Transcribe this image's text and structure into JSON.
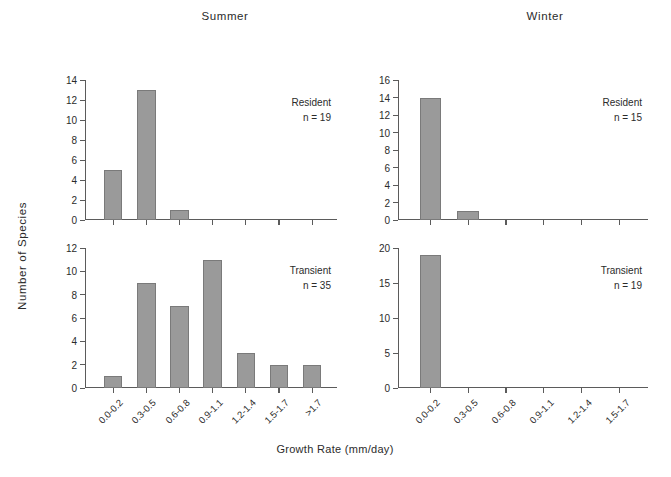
{
  "figure": {
    "x_axis_title": "Growth Rate (mm/day)",
    "y_axis_title": "Number of Species",
    "bar_color": "#9a9a9a",
    "axis_color": "#5b5b5b",
    "background": "#ffffff"
  },
  "columns": [
    {
      "key": "summer",
      "title": "Summer"
    },
    {
      "key": "winter",
      "title": "Winter"
    }
  ],
  "panels": [
    {
      "id": "summer-resident",
      "season": "Summer",
      "group": "Resident",
      "n_label": "n = 19",
      "categories": [
        "0.0-0.2",
        "0.3-0.5",
        "0.6-0.8",
        "0.9-1.1",
        "1.2-1.4",
        "1.5-1.7",
        ">1.7"
      ],
      "values": [
        5,
        13,
        1,
        0,
        0,
        0,
        0
      ],
      "yticks": [
        0,
        2,
        4,
        6,
        8,
        10,
        12,
        14
      ],
      "ymax": 14,
      "show_xlabels": false
    },
    {
      "id": "summer-transient",
      "season": "Summer",
      "group": "Transient",
      "n_label": "n = 35",
      "categories": [
        "0.0-0.2",
        "0.3-0.5",
        "0.6-0.8",
        "0.9-1.1",
        "1.2-1.4",
        "1.5-1.7",
        ">1.7"
      ],
      "values": [
        1,
        9,
        7,
        11,
        3,
        2,
        2
      ],
      "yticks": [
        0,
        2,
        4,
        6,
        8,
        10,
        12
      ],
      "ymax": 12,
      "show_xlabels": true
    },
    {
      "id": "winter-resident",
      "season": "Winter",
      "group": "Resident",
      "n_label": "n = 15",
      "categories": [
        "0.0-0.2",
        "0.3-0.5",
        "0.6-0.8",
        "0.9-1.1",
        "1.2-1.4",
        "1.5-1.7"
      ],
      "values": [
        14,
        1,
        0,
        0,
        0,
        0
      ],
      "yticks": [
        0,
        2,
        4,
        6,
        8,
        10,
        12,
        14,
        16
      ],
      "ymax": 16,
      "show_xlabels": false
    },
    {
      "id": "winter-transient",
      "season": "Winter",
      "group": "Transient",
      "n_label": "n = 19",
      "categories": [
        "0.0-0.2",
        "0.3-0.5",
        "0.6-0.8",
        "0.9-1.1",
        "1.2-1.4",
        "1.5-1.7"
      ],
      "values": [
        19,
        0,
        0,
        0,
        0,
        0
      ],
      "yticks": [
        0,
        5,
        10,
        15,
        20
      ],
      "ymax": 20,
      "show_xlabels": true
    }
  ],
  "chart_data": {
    "type": "bar",
    "title": "",
    "xlabel": "Growth Rate (mm/day)",
    "ylabel": "Number of Species",
    "grid": false,
    "legend": "none",
    "panel_layout": "2 columns (Summer, Winter) x 2 rows (Resident, Transient)",
    "panels": [
      {
        "name": "Summer Resident",
        "season": "Summer",
        "group": "Resident",
        "n": 19,
        "categories": [
          "0.0-0.2",
          "0.3-0.5",
          "0.6-0.8",
          "0.9-1.1",
          "1.2-1.4",
          "1.5-1.7",
          ">1.7"
        ],
        "values": [
          5,
          13,
          1,
          0,
          0,
          0,
          0
        ],
        "ylim": [
          0,
          14
        ],
        "yticks": [
          0,
          2,
          4,
          6,
          8,
          10,
          12,
          14
        ]
      },
      {
        "name": "Summer Transient",
        "season": "Summer",
        "group": "Transient",
        "n": 35,
        "categories": [
          "0.0-0.2",
          "0.3-0.5",
          "0.6-0.8",
          "0.9-1.1",
          "1.2-1.4",
          "1.5-1.7",
          ">1.7"
        ],
        "values": [
          1,
          9,
          7,
          11,
          3,
          2,
          2
        ],
        "ylim": [
          0,
          12
        ],
        "yticks": [
          0,
          2,
          4,
          6,
          8,
          10,
          12
        ]
      },
      {
        "name": "Winter Resident",
        "season": "Winter",
        "group": "Resident",
        "n": 15,
        "categories": [
          "0.0-0.2",
          "0.3-0.5",
          "0.6-0.8",
          "0.9-1.1",
          "1.2-1.4",
          "1.5-1.7"
        ],
        "values": [
          14,
          1,
          0,
          0,
          0,
          0
        ],
        "ylim": [
          0,
          16
        ],
        "yticks": [
          0,
          2,
          4,
          6,
          8,
          10,
          12,
          14,
          16
        ]
      },
      {
        "name": "Winter Transient",
        "season": "Winter",
        "group": "Transient",
        "n": 19,
        "categories": [
          "0.0-0.2",
          "0.3-0.5",
          "0.6-0.8",
          "0.9-1.1",
          "1.2-1.4",
          "1.5-1.7"
        ],
        "values": [
          19,
          0,
          0,
          0,
          0,
          0
        ],
        "ylim": [
          0,
          20
        ],
        "yticks": [
          0,
          5,
          10,
          15,
          20
        ]
      }
    ]
  }
}
